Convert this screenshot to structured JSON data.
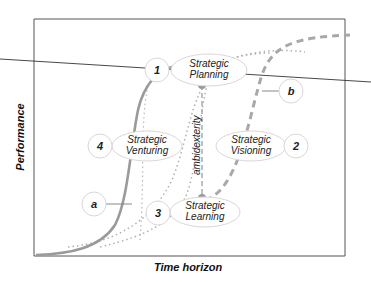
{
  "diagram": {
    "axes": {
      "x_label": "Time horizon",
      "y_label": "Performance"
    },
    "nodes": [
      {
        "number": "1",
        "line1": "Strategic",
        "line2": "Planning"
      },
      {
        "number": "2",
        "line1": "Strategic",
        "line2": "Visioning"
      },
      {
        "number": "3",
        "line1": "Strategic",
        "line2": "Learning"
      },
      {
        "number": "4",
        "line1": "Strategic",
        "line2": "Venturing"
      }
    ],
    "curve_labels": {
      "a": "a",
      "b": "b"
    },
    "vertical_label": "ambidexterity",
    "colors": {
      "curve_solid": "#9a9a9a",
      "curve_dashed": "#a8a8a8",
      "curve_dotted": "#b0b0b0",
      "frame": "#444444",
      "ellipse_stroke": "#d8d8d8"
    }
  }
}
